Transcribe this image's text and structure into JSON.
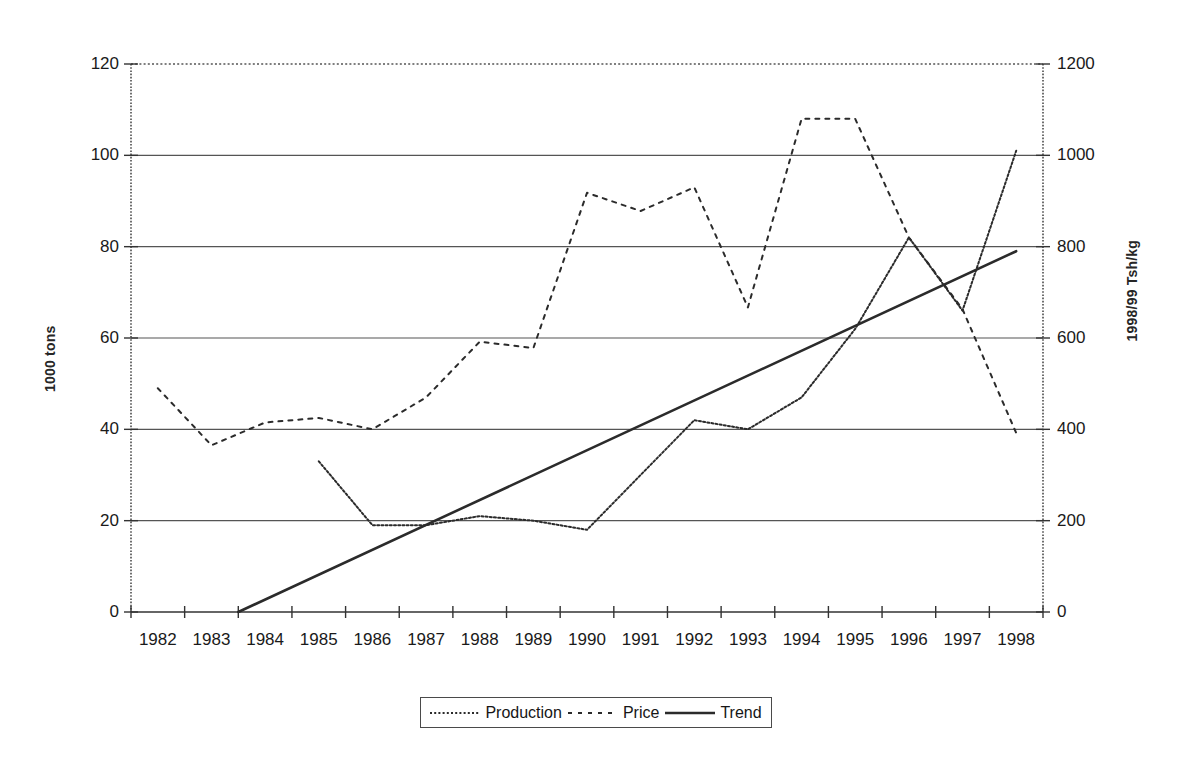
{
  "chart_data": {
    "type": "line",
    "title": "",
    "xlabel": "",
    "ylabel": "1000 tons",
    "y2label": "1998/99 Tsh/kg",
    "grid": true,
    "legend_position": "bottom",
    "categories": [
      "1982",
      "1983",
      "1984",
      "1985",
      "1986",
      "1987",
      "1988",
      "1989",
      "1990",
      "1991",
      "1992",
      "1993",
      "1994",
      "1995",
      "1996",
      "1997",
      "1998"
    ],
    "ylim": [
      0,
      120
    ],
    "yticks": [
      0,
      20,
      40,
      60,
      80,
      100,
      120
    ],
    "y2lim": [
      0,
      1200
    ],
    "y2ticks": [
      0,
      200,
      400,
      600,
      800,
      1000,
      1200
    ],
    "series": [
      {
        "name": "Production",
        "axis": "left",
        "style": "dotted",
        "unit": "1000 tons",
        "x": [
          "1985",
          "1986",
          "1987",
          "1988",
          "1989",
          "1990",
          "1991",
          "1992",
          "1993",
          "1994",
          "1995",
          "1996",
          "1997",
          "1998"
        ],
        "values": [
          33,
          19,
          19,
          21,
          20,
          18,
          30,
          42,
          40,
          47,
          62,
          82,
          66,
          101
        ]
      },
      {
        "name": "Price",
        "axis": "right",
        "style": "dashed",
        "unit": "1998/99 Tsh/kg",
        "x": [
          "1982",
          "1983",
          "1984",
          "1985",
          "1986",
          "1987",
          "1988",
          "1989",
          "1990",
          "1991",
          "1992",
          "1993",
          "1994",
          "1995",
          "1996",
          "1997",
          "1998"
        ],
        "values": [
          490,
          365,
          415,
          425,
          400,
          470,
          592,
          578,
          918,
          878,
          930,
          667,
          1080,
          1080,
          820,
          663,
          392
        ]
      },
      {
        "name": "Trend",
        "axis": "left",
        "style": "solid",
        "unit": "1000 tons",
        "x": [
          "1983.5",
          "1998"
        ],
        "values": [
          0,
          79
        ]
      }
    ]
  },
  "legend": {
    "items": [
      {
        "label": "Production",
        "style": "dotted"
      },
      {
        "label": "Price",
        "style": "dashed"
      },
      {
        "label": "Trend",
        "style": "solid"
      }
    ]
  },
  "axes": {
    "left_title": "1000 tons",
    "right_title": "1998/99 Tsh/kg",
    "left_ticks": [
      "0",
      "20",
      "40",
      "60",
      "80",
      "100",
      "120"
    ],
    "right_ticks": [
      "0",
      "200",
      "400",
      "600",
      "800",
      "1000",
      "1200"
    ],
    "x_ticks": [
      "1982",
      "1983",
      "1984",
      "1985",
      "1986",
      "1987",
      "1988",
      "1989",
      "1990",
      "1991",
      "1992",
      "1993",
      "1994",
      "1995",
      "1996",
      "1997",
      "1998"
    ]
  },
  "colors": {
    "line": "#2b2b2b",
    "grid": "#555555",
    "axis": "#333333",
    "background": "#ffffff"
  }
}
